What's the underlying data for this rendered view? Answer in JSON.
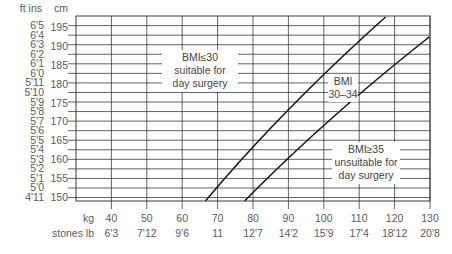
{
  "chart_data": {
    "type": "line",
    "title": "",
    "xlabel": "kg / stones lb",
    "ylabel": "ft ins / cm",
    "xlim": [
      30,
      130
    ],
    "ylim_cm": [
      149,
      198
    ],
    "grid": true,
    "x_axis": {
      "unit_labels": [
        "kg",
        "stones lb"
      ],
      "ticks_kg": [
        40,
        50,
        60,
        70,
        80,
        90,
        100,
        110,
        120,
        130
      ],
      "ticks_stones": [
        "6'3",
        "7'12",
        "9'6",
        "11",
        "12'7",
        "14'2",
        "15'9",
        "17'4",
        "18'12",
        "20'8"
      ]
    },
    "y_axis": {
      "unit_labels": [
        "ft ins",
        "cm"
      ],
      "ticks_cm": [
        195,
        190,
        185,
        180,
        175,
        170,
        165,
        160,
        155,
        150
      ],
      "ticks_ftin": [
        "6'5",
        "6'4",
        "6'3",
        "6'2",
        "6'1",
        "6'0",
        "5'11",
        "5'10",
        "5'9",
        "5'8",
        "5'7",
        "5'6",
        "5'5",
        "5'4",
        "5'3",
        "5'2",
        "5'1",
        "5'0",
        "4'11"
      ]
    },
    "series": [
      {
        "name": "BMI 30",
        "bmi": 30
      },
      {
        "name": "BMI 35",
        "bmi": 35
      }
    ],
    "annotations": [
      {
        "id": "low",
        "lines": [
          "BMI≤30",
          "suitable for",
          "day surgery"
        ]
      },
      {
        "id": "mid",
        "lines": [
          "BMI",
          "30–34"
        ]
      },
      {
        "id": "high",
        "lines": [
          "BMI≥35",
          "unsuitable for",
          "day surgery"
        ]
      }
    ]
  },
  "colors": {
    "grid": "#3a3a3a",
    "line": "#1a1a1a",
    "text": "#5a5a5a"
  }
}
